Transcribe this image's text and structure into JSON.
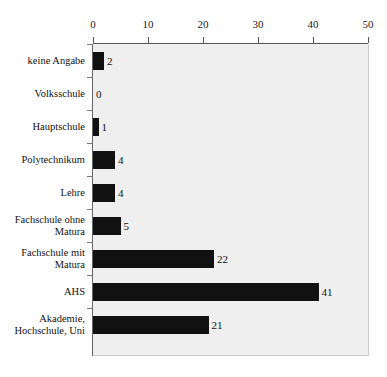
{
  "chart_data": {
    "type": "bar",
    "orientation": "horizontal",
    "title": "",
    "xlabel": "",
    "ylabel": "",
    "xlim": [
      0,
      50
    ],
    "xticks": [
      0,
      10,
      20,
      30,
      40,
      50
    ],
    "xtick_labels": [
      "0",
      "10",
      "20",
      "30",
      "40",
      "50"
    ],
    "grid": false,
    "legend": null,
    "bar_color": "#111111",
    "plot_background": "#efefef",
    "categories": [
      "keine Angabe",
      "Volksschule",
      "Hauptschule",
      "Polytechnikum",
      "Lehre",
      "Fachschule ohne Matura",
      "Fachschule mit Matura",
      "AHS",
      "Akademie, Hochschule, Uni"
    ],
    "values": [
      2,
      0,
      1,
      4,
      4,
      5,
      22,
      41,
      21
    ],
    "data_labels": [
      "2",
      "0",
      "1",
      "4",
      "4",
      "5",
      "22",
      "41",
      "21"
    ],
    "bars": [
      {
        "category_line1": "keine Angabe",
        "category_line2": "",
        "value": 2,
        "label": "2"
      },
      {
        "category_line1": "Volksschule",
        "category_line2": "",
        "value": 0,
        "label": "0"
      },
      {
        "category_line1": "Hauptschule",
        "category_line2": "",
        "value": 1,
        "label": "1"
      },
      {
        "category_line1": "Polytechnikum",
        "category_line2": "",
        "value": 4,
        "label": "4"
      },
      {
        "category_line1": "Lehre",
        "category_line2": "",
        "value": 4,
        "label": "4"
      },
      {
        "category_line1": "Fachschule ohne",
        "category_line2": "Matura",
        "value": 5,
        "label": "5"
      },
      {
        "category_line1": "Fachschule mit",
        "category_line2": "Matura",
        "value": 22,
        "label": "22"
      },
      {
        "category_line1": "AHS",
        "category_line2": "",
        "value": 41,
        "label": "41"
      },
      {
        "category_line1": "Akademie,",
        "category_line2": "Hochschule, Uni",
        "value": 21,
        "label": "21"
      }
    ]
  }
}
